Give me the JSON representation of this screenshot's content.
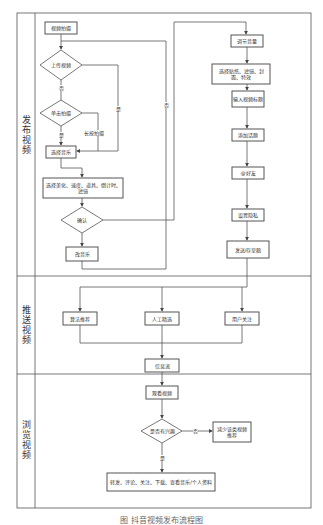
{
  "lanes": [
    {
      "label": "发布视频"
    },
    {
      "label": "推送视频"
    },
    {
      "label": "浏览视频"
    }
  ],
  "publish": {
    "start": "视频拍摄",
    "d_upload": "上传视频",
    "d_tap": "单击拍摄",
    "select_music": "选择音乐",
    "effects": "选择美化、速度、道具、倒计时、滤镜",
    "d_confirm": "确认",
    "change_music": "改音乐",
    "adjust_volume": "调节音量",
    "stickers": "选择贴纸、滤镜、封面、特效",
    "title": "输入视频标题",
    "add_topic": "添加话题",
    "at_friend": "@好友",
    "privacy": "设置隐私",
    "publish": "发送/存草稿"
  },
  "push": {
    "algo": "算法推荐",
    "manual": "人工精选",
    "follow": "用户关注",
    "feed": "信息流"
  },
  "browse": {
    "watch": "观看视频",
    "d_interest": "是否有兴趣",
    "reduce": "减少该类视频推荐",
    "actions": "转发、评论、关注、下载、查看音乐/个人资料"
  },
  "edges": {
    "no": "否",
    "yes": "是",
    "long_press": "长按拍摄",
    "yes2": "是",
    "no2": "否",
    "no3": "否",
    "yes3": "是"
  },
  "caption": "图 抖音视频发布流程图"
}
